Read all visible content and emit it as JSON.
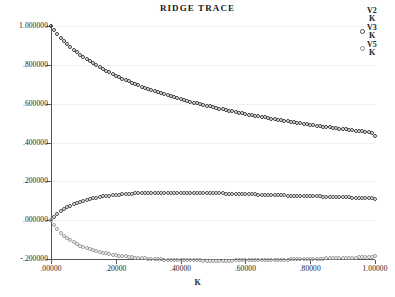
{
  "chart_data": {
    "type": "scatter",
    "title": "RIDGE TRACE",
    "xlabel": "K",
    "ylabel": "",
    "xlim": [
      0.0,
      1.0
    ],
    "ylim": [
      -0.2,
      1.0
    ],
    "grid": true,
    "legend_position": "top-right",
    "xticks": [
      ".00000",
      ".20000",
      ".40000",
      ".60000",
      ".80000",
      "1.00000"
    ],
    "xtick_values": [
      0.0,
      0.2,
      0.4,
      0.6,
      0.8,
      1.0
    ],
    "yticks": [
      "1.000000",
      ".800000",
      ".600000",
      ".400000",
      ".200000",
      ".000000",
      "-.200000"
    ],
    "ytick_values": [
      1.0,
      0.8,
      0.6,
      0.4,
      0.2,
      0.0,
      -0.2
    ],
    "series": [
      {
        "name": "V2/K",
        "numerator": "V2",
        "denominator": "K",
        "color": "#3a3a3a",
        "marker": "open-circle",
        "x": [
          0.0,
          0.01,
          0.02,
          0.03,
          0.04,
          0.05,
          0.06,
          0.07,
          0.08,
          0.09,
          0.1,
          0.11,
          0.12,
          0.13,
          0.14,
          0.15,
          0.16,
          0.17,
          0.18,
          0.19,
          0.2,
          0.21,
          0.22,
          0.23,
          0.24,
          0.25,
          0.26,
          0.27,
          0.28,
          0.29,
          0.3,
          0.31,
          0.32,
          0.33,
          0.34,
          0.35,
          0.36,
          0.37,
          0.38,
          0.39,
          0.4,
          0.41,
          0.42,
          0.43,
          0.44,
          0.45,
          0.46,
          0.47,
          0.48,
          0.49,
          0.5,
          0.51,
          0.52,
          0.53,
          0.54,
          0.55,
          0.56,
          0.57,
          0.58,
          0.59,
          0.6,
          0.61,
          0.62,
          0.63,
          0.64,
          0.65,
          0.66,
          0.67,
          0.68,
          0.69,
          0.7,
          0.71,
          0.72,
          0.73,
          0.74,
          0.75,
          0.76,
          0.77,
          0.78,
          0.79,
          0.8,
          0.81,
          0.82,
          0.83,
          0.84,
          0.85,
          0.86,
          0.87,
          0.88,
          0.89,
          0.9,
          0.91,
          0.92,
          0.93,
          0.94,
          0.95,
          0.96,
          0.97,
          0.98,
          0.99,
          1.0
        ],
        "y": [
          1.0,
          0.978,
          0.958,
          0.94,
          0.923,
          0.907,
          0.892,
          0.878,
          0.865,
          0.852,
          0.84,
          0.829,
          0.818,
          0.807,
          0.797,
          0.788,
          0.778,
          0.769,
          0.761,
          0.752,
          0.744,
          0.737,
          0.729,
          0.722,
          0.715,
          0.708,
          0.701,
          0.695,
          0.688,
          0.682,
          0.676,
          0.671,
          0.665,
          0.659,
          0.654,
          0.649,
          0.644,
          0.639,
          0.634,
          0.629,
          0.624,
          0.62,
          0.615,
          0.611,
          0.606,
          0.602,
          0.598,
          0.594,
          0.59,
          0.586,
          0.582,
          0.578,
          0.575,
          0.571,
          0.567,
          0.564,
          0.56,
          0.557,
          0.554,
          0.55,
          0.547,
          0.544,
          0.541,
          0.538,
          0.535,
          0.532,
          0.529,
          0.526,
          0.523,
          0.52,
          0.517,
          0.515,
          0.512,
          0.509,
          0.507,
          0.504,
          0.501,
          0.499,
          0.496,
          0.494,
          0.492,
          0.489,
          0.487,
          0.485,
          0.482,
          0.48,
          0.478,
          0.476,
          0.473,
          0.471,
          0.469,
          0.467,
          0.465,
          0.463,
          0.461,
          0.459,
          0.457,
          0.455,
          0.453,
          0.451,
          0.436
        ]
      },
      {
        "name": "V3/K",
        "numerator": "V3",
        "denominator": "K",
        "color": "#4a4a4a",
        "marker": "open-circle",
        "x": [
          0.0,
          0.01,
          0.02,
          0.03,
          0.04,
          0.05,
          0.06,
          0.07,
          0.08,
          0.09,
          0.1,
          0.11,
          0.12,
          0.13,
          0.14,
          0.15,
          0.16,
          0.17,
          0.18,
          0.19,
          0.2,
          0.21,
          0.22,
          0.23,
          0.24,
          0.25,
          0.26,
          0.27,
          0.28,
          0.29,
          0.3,
          0.31,
          0.32,
          0.33,
          0.34,
          0.35,
          0.36,
          0.37,
          0.38,
          0.39,
          0.4,
          0.41,
          0.42,
          0.43,
          0.44,
          0.45,
          0.46,
          0.47,
          0.48,
          0.49,
          0.5,
          0.51,
          0.52,
          0.53,
          0.54,
          0.55,
          0.56,
          0.57,
          0.58,
          0.59,
          0.6,
          0.61,
          0.62,
          0.63,
          0.64,
          0.65,
          0.66,
          0.67,
          0.68,
          0.69,
          0.7,
          0.71,
          0.72,
          0.73,
          0.74,
          0.75,
          0.76,
          0.77,
          0.78,
          0.79,
          0.8,
          0.81,
          0.82,
          0.83,
          0.84,
          0.85,
          0.86,
          0.87,
          0.88,
          0.89,
          0.9,
          0.91,
          0.92,
          0.93,
          0.94,
          0.95,
          0.96,
          0.97,
          0.98,
          0.99,
          1.0
        ],
        "y": [
          0.0,
          0.018,
          0.033,
          0.046,
          0.057,
          0.066,
          0.075,
          0.082,
          0.089,
          0.095,
          0.1,
          0.105,
          0.109,
          0.113,
          0.116,
          0.119,
          0.122,
          0.124,
          0.127,
          0.129,
          0.13,
          0.132,
          0.133,
          0.135,
          0.136,
          0.137,
          0.138,
          0.139,
          0.139,
          0.14,
          0.14,
          0.141,
          0.141,
          0.141,
          0.142,
          0.142,
          0.142,
          0.142,
          0.142,
          0.142,
          0.142,
          0.142,
          0.141,
          0.141,
          0.141,
          0.141,
          0.14,
          0.14,
          0.14,
          0.139,
          0.139,
          0.139,
          0.138,
          0.138,
          0.137,
          0.137,
          0.136,
          0.136,
          0.135,
          0.135,
          0.134,
          0.134,
          0.133,
          0.133,
          0.132,
          0.132,
          0.131,
          0.131,
          0.13,
          0.13,
          0.129,
          0.128,
          0.128,
          0.127,
          0.127,
          0.126,
          0.126,
          0.125,
          0.124,
          0.124,
          0.123,
          0.123,
          0.122,
          0.122,
          0.121,
          0.121,
          0.12,
          0.119,
          0.119,
          0.118,
          0.118,
          0.117,
          0.117,
          0.116,
          0.116,
          0.115,
          0.114,
          0.114,
          0.113,
          0.113,
          0.11
        ]
      },
      {
        "name": "V5/K",
        "numerator": "V5",
        "denominator": "K",
        "color": "#9a9a9a",
        "marker": "open-circle",
        "x": [
          0.0,
          0.01,
          0.02,
          0.03,
          0.04,
          0.05,
          0.06,
          0.07,
          0.08,
          0.09,
          0.1,
          0.11,
          0.12,
          0.13,
          0.14,
          0.15,
          0.16,
          0.17,
          0.18,
          0.19,
          0.2,
          0.21,
          0.22,
          0.23,
          0.24,
          0.25,
          0.26,
          0.27,
          0.28,
          0.29,
          0.3,
          0.31,
          0.32,
          0.33,
          0.34,
          0.35,
          0.36,
          0.37,
          0.38,
          0.39,
          0.4,
          0.41,
          0.42,
          0.43,
          0.44,
          0.45,
          0.46,
          0.47,
          0.48,
          0.49,
          0.5,
          0.51,
          0.52,
          0.53,
          0.54,
          0.55,
          0.56,
          0.57,
          0.58,
          0.59,
          0.6,
          0.61,
          0.62,
          0.63,
          0.64,
          0.65,
          0.66,
          0.67,
          0.68,
          0.69,
          0.7,
          0.71,
          0.72,
          0.73,
          0.74,
          0.75,
          0.76,
          0.77,
          0.78,
          0.79,
          0.8,
          0.81,
          0.82,
          0.83,
          0.84,
          0.85,
          0.86,
          0.87,
          0.88,
          0.89,
          0.9,
          0.91,
          0.92,
          0.93,
          0.94,
          0.95,
          0.96,
          0.97,
          0.98,
          0.99,
          1.0
        ],
        "y": [
          0.0,
          -0.026,
          -0.047,
          -0.065,
          -0.08,
          -0.093,
          -0.104,
          -0.114,
          -0.123,
          -0.131,
          -0.138,
          -0.144,
          -0.15,
          -0.155,
          -0.16,
          -0.164,
          -0.168,
          -0.171,
          -0.175,
          -0.178,
          -0.18,
          -0.183,
          -0.185,
          -0.187,
          -0.189,
          -0.191,
          -0.193,
          -0.194,
          -0.196,
          -0.197,
          -0.198,
          -0.199,
          -0.2,
          -0.201,
          -0.202,
          -0.203,
          -0.203,
          -0.204,
          -0.205,
          -0.205,
          -0.206,
          -0.206,
          -0.206,
          -0.207,
          -0.207,
          -0.207,
          -0.207,
          -0.208,
          -0.208,
          -0.208,
          -0.208,
          -0.208,
          -0.208,
          -0.208,
          -0.208,
          -0.208,
          -0.208,
          -0.207,
          -0.207,
          -0.207,
          -0.207,
          -0.207,
          -0.206,
          -0.206,
          -0.206,
          -0.206,
          -0.205,
          -0.205,
          -0.205,
          -0.204,
          -0.204,
          -0.204,
          -0.203,
          -0.203,
          -0.202,
          -0.202,
          -0.202,
          -0.201,
          -0.201,
          -0.2,
          -0.2,
          -0.199,
          -0.199,
          -0.198,
          -0.198,
          -0.197,
          -0.197,
          -0.196,
          -0.196,
          -0.195,
          -0.195,
          -0.194,
          -0.194,
          -0.193,
          -0.193,
          -0.192,
          -0.192,
          -0.191,
          -0.191,
          -0.19,
          -0.186
        ]
      }
    ]
  },
  "legend": [
    {
      "numerator": "V2",
      "denominator": "K",
      "marker": "none"
    },
    {
      "numerator": "V3",
      "denominator": "K",
      "marker": "open-circle"
    },
    {
      "numerator": "V5",
      "denominator": "K",
      "marker": "open-circle-faint"
    }
  ]
}
